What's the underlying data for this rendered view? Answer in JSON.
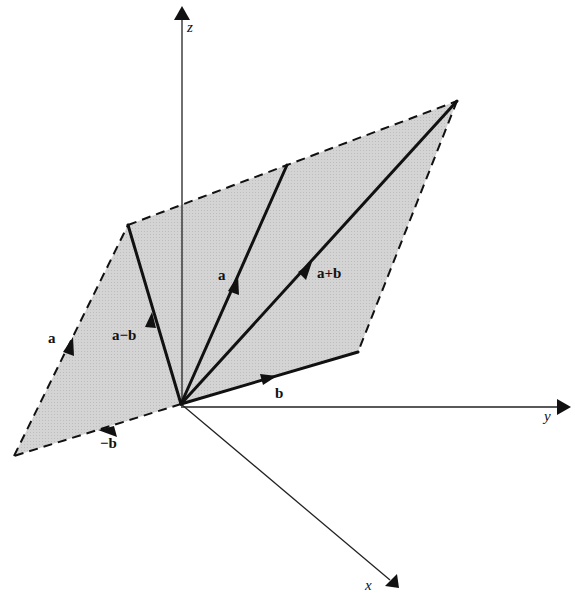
{
  "diagram": {
    "colors": {
      "background": "#ffffff",
      "plane_fill": "#d2d2d2",
      "line": "#111111"
    },
    "origin": [
      181,
      404
    ],
    "axes": {
      "z": {
        "label": "z",
        "tip": [
          182,
          8
        ]
      },
      "y": {
        "label": "y",
        "tip": [
          570,
          407
        ]
      },
      "x": {
        "label": "x",
        "tip": [
          398,
          587
        ]
      }
    },
    "points": {
      "a_tip": [
        287,
        165
      ],
      "b_tip": [
        358,
        352
      ],
      "a_plus_b_tip": [
        457,
        101
      ],
      "a_minus_b_tip": [
        128,
        225
      ],
      "neg_b_tip": [
        14,
        456
      ]
    },
    "vectors": [
      {
        "id": "a",
        "label": "a",
        "style": "solid"
      },
      {
        "id": "b",
        "label": "b",
        "style": "solid"
      },
      {
        "id": "a_plus_b",
        "label": "a+b",
        "style": "solid"
      },
      {
        "id": "a_minus_b",
        "label": "a−b",
        "style": "solid"
      },
      {
        "id": "a_shifted",
        "label": "a",
        "style": "dashed"
      },
      {
        "id": "neg_b",
        "label": "−b",
        "style": "dashed"
      }
    ],
    "labels": {
      "a_main": "a",
      "b_main": "b",
      "a_plus_b": "a+b",
      "a_minus_b": "a−b",
      "a_shifted": "a",
      "neg_b": "−b",
      "axis_x": "x",
      "axis_y": "y",
      "axis_z": "z"
    }
  }
}
